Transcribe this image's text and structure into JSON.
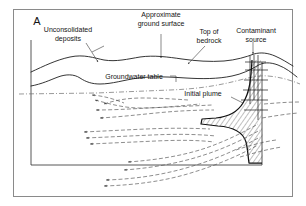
{
  "figure": {
    "panel_letter": "A",
    "type": "hydrogeologic block diagram",
    "background_color": "#ffffff",
    "frame_color": "#8a8a8a"
  },
  "labels": {
    "unconsolidated_deposits_line1": "Unconsolidated",
    "unconsolidated_deposits_line2": "deposits",
    "approximate_ground_surface_line1": "Approximate",
    "approximate_ground_surface_line2": "ground surface",
    "top_of_bedrock_line1": "Top of",
    "top_of_bedrock_line2": "bedrock",
    "contaminant_source_line1": "Contaminant",
    "contaminant_source_line2": "source",
    "groundwater_table": "Groundwater table",
    "initial_plume": "Initial plume"
  },
  "features": {
    "ground_surface": "undulating solid line across top of block",
    "bedrock_surface": "second solid undulating line below ground surface",
    "water_table": "dash-dot horizontal line",
    "flow_lines": "dashed arrowed groundwater flow paths",
    "plume": "hatched contaminant plume descending from source then spreading",
    "source_well": "vertical source column at right side"
  },
  "colors": {
    "ink": "#1e1e1e",
    "flow_line": "#5d5d5d",
    "water_table": "#6d6d6d",
    "plume_outline": "#111111",
    "hatch": "#4a4a4a"
  }
}
